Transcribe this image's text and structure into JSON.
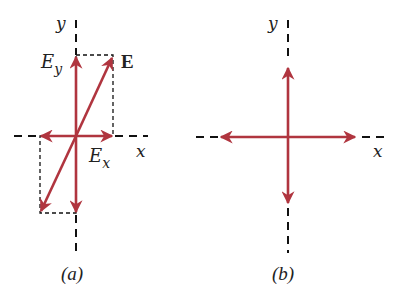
{
  "figure": {
    "accent_color": "#b0353f",
    "panel_a": {
      "caption": "(a)",
      "x_axis_label": "x",
      "y_axis_label": "y",
      "vector_label": "E",
      "component_x_label": "E",
      "component_x_sub": "x",
      "component_y_label": "E",
      "component_y_sub": "y"
    },
    "panel_b": {
      "caption": "(b)",
      "x_axis_label": "x",
      "y_axis_label": "y"
    }
  }
}
